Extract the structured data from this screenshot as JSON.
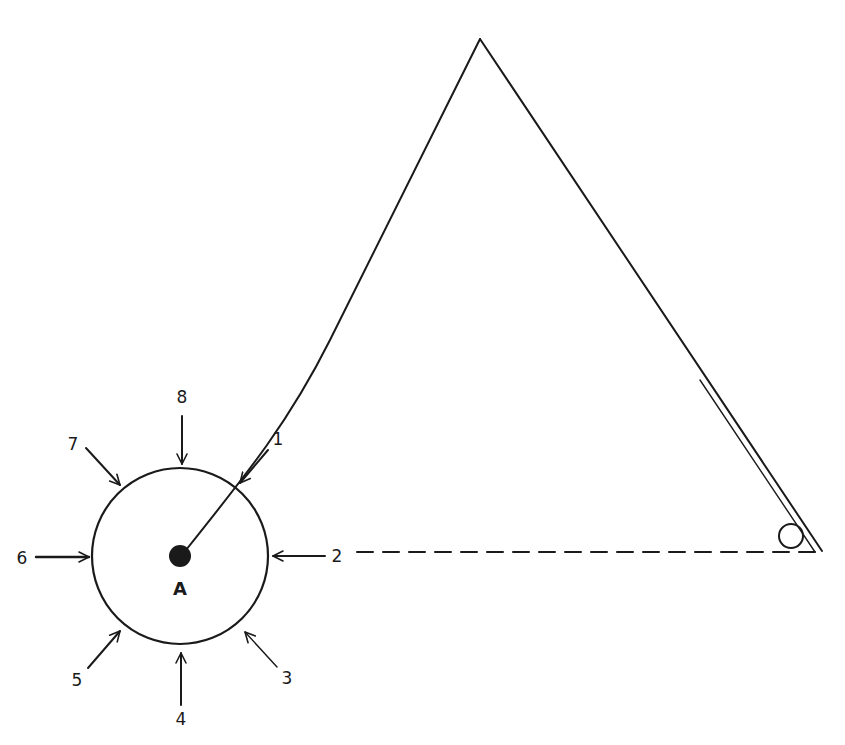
{
  "diagram": {
    "center_label": "A",
    "arrows": [
      {
        "label": "1",
        "direction": "from upper-right"
      },
      {
        "label": "2",
        "direction": "from right"
      },
      {
        "label": "3",
        "direction": "from lower-right"
      },
      {
        "label": "4",
        "direction": "from below"
      },
      {
        "label": "5",
        "direction": "from lower-left"
      },
      {
        "label": "6",
        "direction": "from left"
      },
      {
        "label": "7",
        "direction": "from upper-left"
      },
      {
        "label": "8",
        "direction": "from above"
      }
    ],
    "colors": {
      "ink": "#1a1a1a",
      "background": "#ffffff"
    }
  }
}
